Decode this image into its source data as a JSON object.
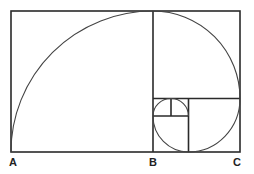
{
  "diagram": {
    "type": "golden-spiral",
    "stroke_color": "#2a2a2a",
    "labels": [
      {
        "id": "A",
        "text": "A",
        "x": 13,
        "y": 157
      },
      {
        "id": "B",
        "text": "B",
        "x": 153,
        "y": 157
      },
      {
        "id": "C",
        "text": "C",
        "x": 237,
        "y": 157
      }
    ]
  }
}
